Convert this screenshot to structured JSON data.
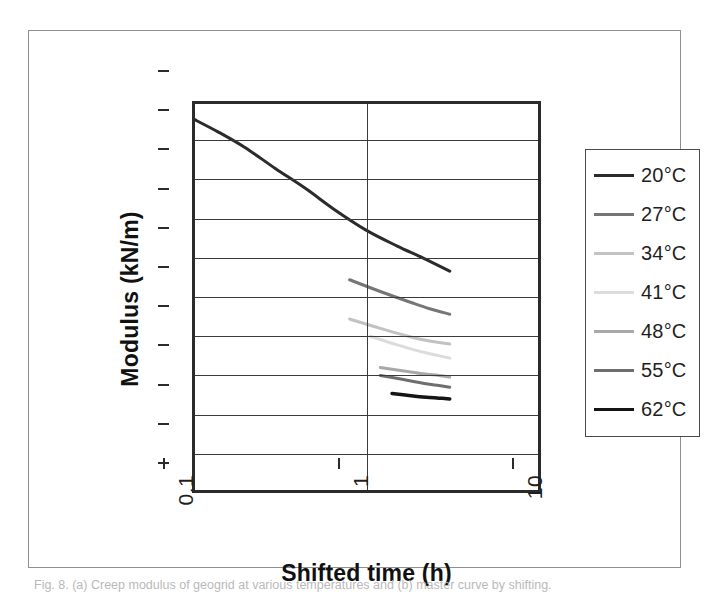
{
  "figure": {
    "caption": "Fig. 8. (a) Creep modulus of geogrid at various temperatures and (b) master curve by shifting."
  },
  "chart_data": {
    "type": "line",
    "title": "",
    "xlabel": "Shifted time (h)",
    "ylabel": "Modulus (kN/m)",
    "xscale": "log",
    "xlim": [
      0.1,
      10
    ],
    "ylim": [
      0,
      500
    ],
    "xticks": [
      "0.1",
      "1",
      "10"
    ],
    "xtick_values": [
      0.1,
      1,
      10
    ],
    "yticks": [
      "0",
      "50",
      "100",
      "150",
      "200",
      "250",
      "300",
      "350",
      "400",
      "450",
      "500"
    ],
    "ytick_values": [
      0,
      50,
      100,
      150,
      200,
      250,
      300,
      350,
      400,
      450,
      500
    ],
    "grid": "horizontal-and-vertical",
    "legend_position": "right-outside",
    "series": [
      {
        "name": "20°C",
        "color": "#2b2b2b",
        "width": 3.0,
        "x": [
          0.1,
          0.14,
          0.2,
          0.3,
          0.45,
          0.65,
          1.0,
          1.5,
          2.1,
          3.0
        ],
        "y": [
          478,
          461,
          441,
          414,
          388,
          362,
          335,
          315,
          300,
          283
        ]
      },
      {
        "name": "27°C",
        "color": "#767676",
        "width": 3.0,
        "x": [
          0.8,
          1.2,
          1.8,
          2.3,
          3.0
        ],
        "y": [
          272,
          257,
          243,
          235,
          228
        ]
      },
      {
        "name": "34°C",
        "color": "#c2c2c2",
        "width": 3.0,
        "x": [
          0.8,
          1.2,
          1.8,
          2.3,
          3.0
        ],
        "y": [
          222,
          210,
          199,
          194,
          190
        ]
      },
      {
        "name": "41°C",
        "color": "#dcdcdc",
        "width": 3.0,
        "x": [
          1.05,
          1.5,
          2.0,
          2.5,
          3.0
        ],
        "y": [
          200,
          189,
          181,
          176,
          172
        ]
      },
      {
        "name": "48°C",
        "color": "#a8a8a8",
        "width": 3.0,
        "x": [
          1.2,
          1.6,
          2.1,
          2.6,
          3.0
        ],
        "y": [
          160,
          156,
          152,
          150,
          148
        ]
      },
      {
        "name": "55°C",
        "color": "#6e6e6e",
        "width": 3.0,
        "x": [
          1.2,
          1.6,
          2.1,
          2.6,
          3.0
        ],
        "y": [
          150,
          145,
          140,
          137,
          135
        ]
      },
      {
        "name": "62°C",
        "color": "#141414",
        "width": 3.5,
        "x": [
          1.4,
          1.8,
          2.2,
          2.6,
          3.0
        ],
        "y": [
          127,
          124,
          122,
          121,
          120
        ]
      }
    ]
  }
}
